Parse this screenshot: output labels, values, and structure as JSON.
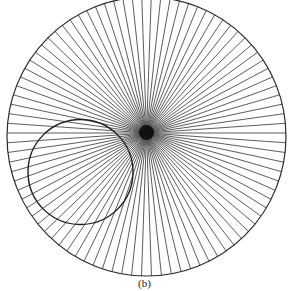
{
  "figure": {
    "caption": "(b)",
    "background": "#ffffff",
    "outer_circle": {
      "cx": 146.5,
      "cy": 136.5,
      "r": 139.5,
      "stroke": "#2a2a2a",
      "stroke_width": 1.2
    },
    "inner_circle": {
      "cx": 80.5,
      "cy": 172,
      "r": 52.5,
      "stroke": "#1e1e1e",
      "stroke_width": 1.4
    },
    "rays": {
      "origin_x": 146.5,
      "origin_y": 133,
      "count": 90,
      "start_angle_deg": 0,
      "stroke": "#4a4a4a",
      "stroke_width": 0.9
    },
    "center_blob": {
      "cx": 146.5,
      "cy": 132.5,
      "r": 7.5,
      "fill": "#111111"
    }
  }
}
